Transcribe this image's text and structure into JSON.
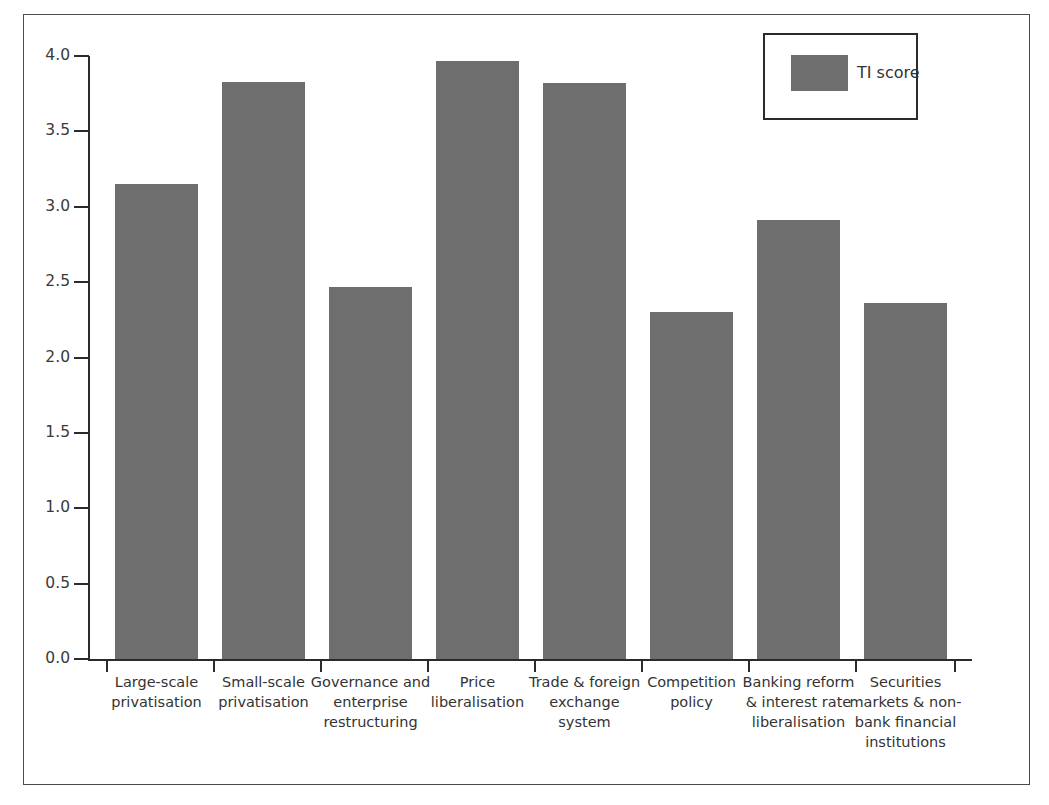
{
  "figure": {
    "clipped_caption": "",
    "background": "#ffffff",
    "frame_color": "#4a4a4a"
  },
  "legend": {
    "position": "top-right",
    "entries": [
      {
        "label": "TI score",
        "color": "#6e6e6e"
      }
    ]
  },
  "axis": {
    "y_ticks": [
      "4.0",
      "3.5",
      "3.0",
      "2.5",
      "2.0",
      "1.5",
      "1.0",
      "0.5",
      "0.0"
    ],
    "y_min": 0.0,
    "y_max": 4.0,
    "y_step": 0.5
  },
  "chart_data": {
    "type": "bar",
    "title": "",
    "xlabel": "",
    "ylabel": "",
    "ylim": [
      0,
      4
    ],
    "grid": false,
    "legend_position": "top-right",
    "series_name": "TI score",
    "bar_color": "#6e6e6e",
    "categories": [
      "Large-scale privatisation",
      "Small-scale privatisation",
      "Governance and enterprise restructuring",
      "Price liberalisation",
      "Trade & foreign exchange system",
      "Competition policy",
      "Banking reform & interest rate liberalisation",
      "Securities markets & non-bank financial institutions"
    ],
    "values": [
      3.15,
      3.83,
      2.47,
      3.97,
      3.82,
      2.3,
      2.91,
      2.36
    ],
    "series": [
      {
        "name": "TI score",
        "values": [
          3.15,
          3.83,
          2.47,
          3.97,
          3.82,
          2.3,
          2.91,
          2.36
        ]
      }
    ]
  },
  "category_lines": [
    [
      "Large-scale",
      "privatisation"
    ],
    [
      "Small-scale",
      "privatisation"
    ],
    [
      "Governance and",
      "enterprise",
      "restructuring"
    ],
    [
      "Price",
      "liberalisation"
    ],
    [
      "Trade & foreign",
      "exchange system"
    ],
    [
      "Competition",
      "policy"
    ],
    [
      "Banking reform",
      "& interest rate",
      "liberalisation"
    ],
    [
      "Securities",
      "markets & non-",
      "bank financial",
      "institutions"
    ]
  ]
}
